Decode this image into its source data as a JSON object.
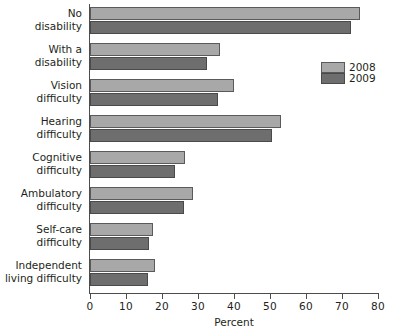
{
  "chart_data": {
    "type": "bar",
    "orientation": "horizontal",
    "title": "",
    "xlabel": "Percent",
    "ylabel": "",
    "xlim": [
      0,
      80
    ],
    "xticks": [
      0,
      10,
      20,
      30,
      40,
      50,
      60,
      70,
      80
    ],
    "grid": false,
    "legend_position": "right",
    "categories": [
      "No disability",
      "With a disability",
      "Vision difficulty",
      "Hearing difficulty",
      "Cognitive difficulty",
      "Ambulatory difficulty",
      "Self-care difficulty",
      "Independent living difficulty"
    ],
    "category_lines": [
      [
        "No",
        "disability"
      ],
      [
        "With a",
        "disability"
      ],
      [
        "Vision",
        "difficulty"
      ],
      [
        "Hearing",
        "difficulty"
      ],
      [
        "Cognitive",
        "difficulty"
      ],
      [
        "Ambulatory",
        "difficulty"
      ],
      [
        "Self-care",
        "difficulty"
      ],
      [
        "Independent",
        "living difficulty"
      ]
    ],
    "series": [
      {
        "name": "2008",
        "color": "#a8a8a8",
        "values": [
          75.0,
          36.0,
          40.0,
          53.0,
          26.5,
          28.5,
          17.5,
          18.0
        ]
      },
      {
        "name": "2009",
        "color": "#6e6e6e",
        "values": [
          72.5,
          32.5,
          35.5,
          50.5,
          23.5,
          26.0,
          16.5,
          16.0
        ]
      }
    ]
  },
  "legend": {
    "items": [
      {
        "label": "2008"
      },
      {
        "label": "2009"
      }
    ]
  },
  "axis": {
    "x_title": "Percent",
    "tick_labels": [
      "0",
      "10",
      "20",
      "30",
      "40",
      "50",
      "60",
      "70",
      "80"
    ]
  }
}
